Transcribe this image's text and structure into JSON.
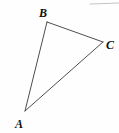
{
  "figure": {
    "type": "geometry-diagram",
    "shape_name": "triangle",
    "background_color": "#fefefe",
    "stroke_color": "#3a3a3a",
    "label_color": "#111111",
    "accent_color": "#b8b8b8",
    "width": 119,
    "height": 133,
    "vertices": [
      {
        "id": "A",
        "label": "A",
        "x": 25,
        "y": 111,
        "label_x": 19,
        "label_y": 124
      },
      {
        "id": "B",
        "label": "B",
        "x": 47,
        "y": 22,
        "label_x": 43,
        "label_y": 13
      },
      {
        "id": "C",
        "label": "C",
        "x": 103,
        "y": 42,
        "label_x": 110,
        "label_y": 45
      }
    ],
    "edges": [
      {
        "id": "AB",
        "from": "A",
        "to": "B",
        "x1": 25,
        "y1": 111,
        "x2": 47,
        "y2": 22
      },
      {
        "id": "BC",
        "from": "B",
        "to": "C",
        "x1": 47,
        "y1": 22,
        "x2": 103,
        "y2": 42
      },
      {
        "id": "AC",
        "from": "A",
        "to": "C",
        "x1": 25,
        "y1": 111,
        "x2": 103,
        "y2": 42
      }
    ],
    "stray_marks": [
      {
        "id": "top-right-rule",
        "x1": 90,
        "y1": 4,
        "x2": 119,
        "y2": 3,
        "color": "#c4c4c4"
      }
    ]
  }
}
